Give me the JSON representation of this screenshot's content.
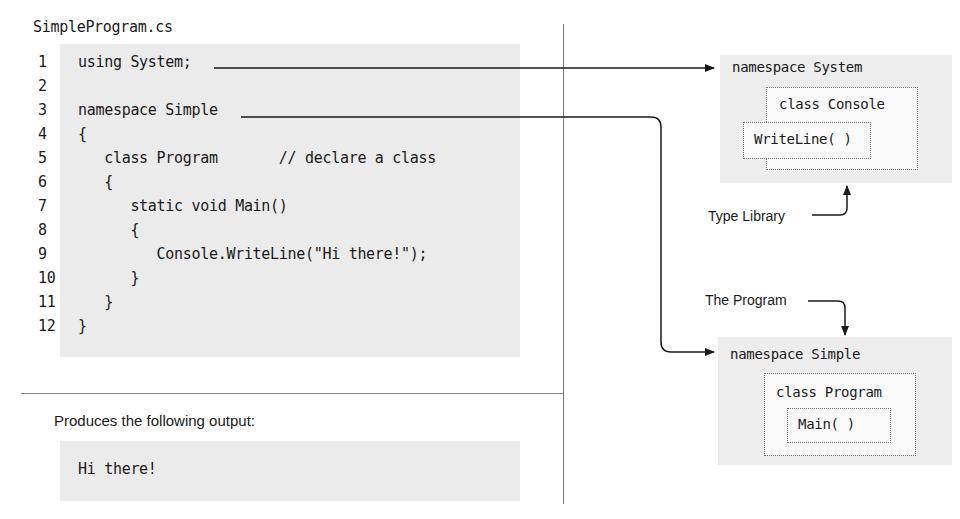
{
  "file": {
    "name": "SimpleProgram.cs"
  },
  "code": {
    "lines": [
      {
        "num": "1",
        "text": "using System;"
      },
      {
        "num": "2",
        "text": ""
      },
      {
        "num": "3",
        "text": "namespace Simple"
      },
      {
        "num": "4",
        "text": "{"
      },
      {
        "num": "5",
        "text": "   class Program       // declare a class"
      },
      {
        "num": "6",
        "text": "   {"
      },
      {
        "num": "7",
        "text": "      static void Main()"
      },
      {
        "num": "8",
        "text": "      {"
      },
      {
        "num": "9",
        "text": "         Console.WriteLine(\"Hi there!\");"
      },
      {
        "num": "10",
        "text": "      }"
      },
      {
        "num": "11",
        "text": "   }"
      },
      {
        "num": "12",
        "text": "}"
      }
    ]
  },
  "output": {
    "caption": "Produces the following output:",
    "text": "Hi there!"
  },
  "diagram": {
    "system": {
      "namespace": "namespace System",
      "class": "class Console",
      "method": "WriteLine( )",
      "note": "Type Library"
    },
    "simple": {
      "namespace": "namespace Simple",
      "class": "class Program",
      "method": "Main( )",
      "note": "The Program"
    }
  },
  "colors": {
    "code_bg": "#ebebeb",
    "diagram_bg": "#ededed",
    "line": "#1a1a1a",
    "divider": "#777777"
  }
}
